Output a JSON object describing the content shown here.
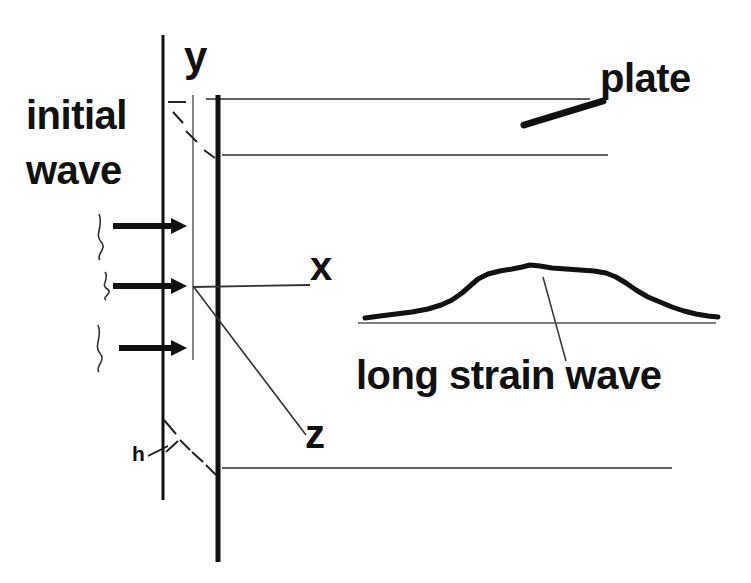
{
  "figure": {
    "kind": "physics-schematic",
    "background_color": "#ffffff",
    "ink_color": "#111111"
  },
  "labels": {
    "initial": "initial",
    "wave": "wave",
    "axis_y": "y",
    "axis_x": "x",
    "axis_z": "z",
    "thickness_h": "h",
    "plate": "plate",
    "long_strain_wave": "long strain wave"
  },
  "chart_data": {
    "type": "line",
    "title": "",
    "xlabel": "",
    "ylabel": "",
    "grid": false,
    "legend": "none",
    "baseline_y": 323,
    "x": [
      365,
      380,
      396,
      412,
      428,
      441,
      452,
      462,
      470,
      478,
      488,
      500,
      512,
      522,
      530,
      540,
      552,
      566,
      580,
      594,
      606,
      616,
      626,
      636,
      648,
      660,
      672,
      684,
      696,
      708,
      718
    ],
    "y": [
      318,
      316,
      314,
      312,
      309,
      305,
      300,
      293,
      286,
      279,
      274,
      271,
      269,
      267,
      265,
      266,
      268,
      269,
      270,
      271,
      273,
      277,
      283,
      290,
      297,
      302,
      307,
      311,
      314,
      316,
      317
    ]
  },
  "geometry": {
    "initial_wave_front_line": {
      "x": 163,
      "y1": 35,
      "y2": 500,
      "width": 3
    },
    "y_axis_line": {
      "x": 193,
      "y1": 95,
      "y2": 360,
      "width": 1.3
    },
    "plate_edge_line": {
      "x": 218,
      "y1": 95,
      "y2": 562,
      "width": 5
    },
    "plate_top_line": {
      "x1": 206,
      "x2": 590,
      "y": 99
    },
    "plate_mid_line": {
      "x1": 222,
      "x2": 608,
      "y": 155
    },
    "plate_bottom_line": {
      "x1": 222,
      "x2": 672,
      "y": 468
    },
    "x_axis_line": {
      "x1": 193,
      "y1": 287,
      "x2": 310,
      "y2": 285
    },
    "z_axis_line": {
      "x1": 193,
      "y1": 286,
      "x2": 306,
      "y2": 435
    },
    "plate_pointer_line": {
      "x1": 524,
      "y1": 125,
      "x2": 603,
      "y2": 101
    },
    "lsw_pointer_line": {
      "x1": 543,
      "y1": 277,
      "x2": 566,
      "y2": 361
    },
    "wave_baseline": {
      "x1": 358,
      "x2": 716,
      "y": 323
    },
    "h_pointer_line": {
      "x1": 148,
      "y1": 456,
      "x2": 168,
      "y2": 446
    },
    "arrows": [
      {
        "x1": 113,
        "x2": 187,
        "y": 226
      },
      {
        "x1": 113,
        "x2": 187,
        "y": 286
      },
      {
        "x1": 119,
        "x2": 187,
        "y": 348
      }
    ],
    "arrow_thickness": 6,
    "dashes_upper": [
      {
        "x1": 168,
        "y1": 102,
        "x2": 186,
        "y2": 102
      },
      {
        "x1": 173,
        "y1": 112,
        "x2": 183,
        "y2": 123
      },
      {
        "x1": 186,
        "y1": 131,
        "x2": 197,
        "y2": 142
      },
      {
        "x1": 204,
        "y1": 150,
        "x2": 215,
        "y2": 158
      }
    ],
    "dashes_lower": [
      {
        "x1": 164,
        "y1": 420,
        "x2": 176,
        "y2": 434
      },
      {
        "x1": 180,
        "y1": 440,
        "x2": 190,
        "y2": 450
      },
      {
        "x1": 166,
        "y1": 452,
        "x2": 178,
        "y2": 441
      },
      {
        "x1": 192,
        "y1": 452,
        "x2": 203,
        "y2": 462
      },
      {
        "x1": 206,
        "y1": 465,
        "x2": 216,
        "y2": 475
      }
    ],
    "left_squiggles": [
      {
        "x": 99,
        "y1": 214,
        "y2": 260
      },
      {
        "x": 105,
        "y1": 272,
        "y2": 300
      },
      {
        "x": 98,
        "y1": 325,
        "y2": 372
      }
    ]
  }
}
